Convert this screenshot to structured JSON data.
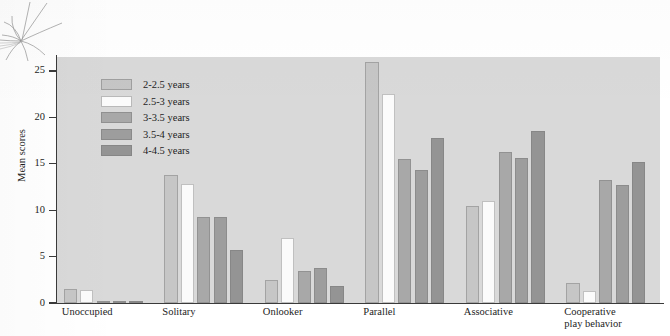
{
  "chart_data": {
    "type": "bar",
    "title": "",
    "xlabel": "",
    "ylabel": "Mean scores",
    "ylim": [
      0,
      26.5
    ],
    "yticks": [
      0,
      5,
      10,
      15,
      20,
      25
    ],
    "ytick_labels": [
      "0",
      "5",
      "10",
      "15",
      "20",
      "25"
    ],
    "grid": false,
    "legend_position": "upper-left-inside",
    "categories": [
      "Unoccupied",
      "Solitary",
      "Onlooker",
      "Parallel",
      "Associative",
      "Cooperative\nplay behavior"
    ],
    "series": [
      {
        "name": "2-2.5 years",
        "color": "#c6c6c6",
        "values": [
          1.5,
          13.8,
          2.5,
          26.0,
          10.4,
          2.2
        ]
      },
      {
        "name": "2.5-3 years",
        "color": "#fbfbfb",
        "values": [
          1.4,
          12.8,
          7.0,
          22.5,
          11.0,
          1.3
        ]
      },
      {
        "name": "3-3.5 years",
        "color": "#a8a8a8",
        "values": [
          0.2,
          9.3,
          3.5,
          15.5,
          16.3,
          13.3
        ]
      },
      {
        "name": "3.5-4 years",
        "color": "#9d9d9d",
        "values": [
          0.15,
          9.3,
          3.8,
          14.3,
          15.6,
          12.7
        ]
      },
      {
        "name": "4-4.5 years",
        "color": "#949494",
        "values": [
          0.1,
          5.7,
          1.8,
          17.8,
          18.5,
          15.2
        ]
      }
    ]
  },
  "colors": {
    "plot_background": "#d9d9d9",
    "page_background": "#ffffff",
    "axis": "#3a3a3a",
    "text": "#1d1d1d"
  }
}
